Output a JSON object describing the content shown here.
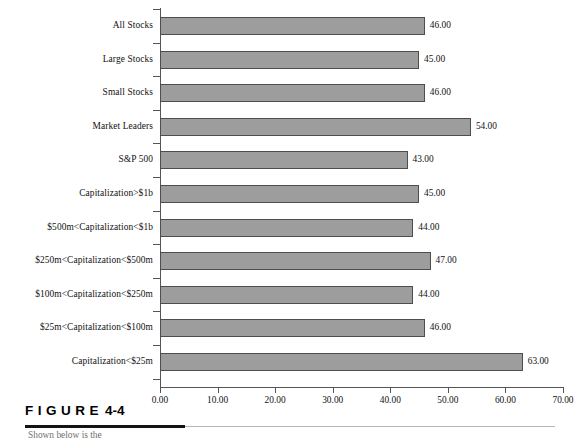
{
  "figure": {
    "label_word": "FIGURE",
    "number": "4-4",
    "caption_clipped": "Shown below is the"
  },
  "chart_data": {
    "type": "bar",
    "orientation": "horizontal",
    "title": "",
    "xlabel": "",
    "ylabel": "",
    "xlim": [
      0,
      70
    ],
    "xticks": [
      "0.00",
      "10.00",
      "20.00",
      "30.00",
      "40.00",
      "50.00",
      "60.00",
      "70.00"
    ],
    "xtick_values": [
      0,
      10,
      20,
      30,
      40,
      50,
      60,
      70
    ],
    "grid": false,
    "legend": "none",
    "bar_color": "#9d9d9d",
    "bar_border_color": "#4d4d4d",
    "axis_color": "#555555",
    "categories": [
      "All Stocks",
      "Large Stocks",
      "Small Stocks",
      "Market Leaders",
      "S&P 500",
      "Capitalization>$1b",
      "$500m<Capitalization<$1b",
      "$250m<Capitalization<$500m",
      "$100m<Capitalization<$250m",
      "$25m<Capitalization<$100m",
      "Capitalization<$25m"
    ],
    "values": [
      46,
      45,
      46,
      54,
      43,
      45,
      44,
      47,
      44,
      46,
      63
    ],
    "value_labels": [
      "46.00",
      "45.00",
      "46.00",
      "54.00",
      "43.00",
      "45.00",
      "44.00",
      "47.00",
      "44.00",
      "46.00",
      "63.00"
    ]
  }
}
